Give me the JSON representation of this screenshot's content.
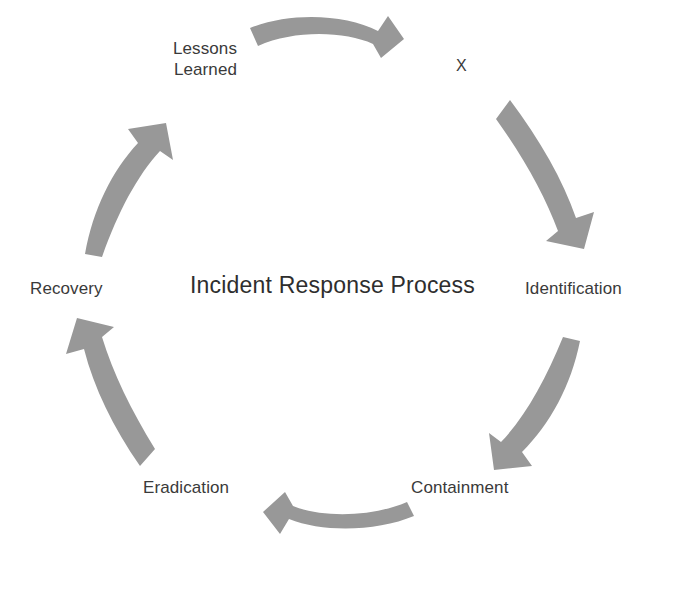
{
  "diagram": {
    "title": "Incident Response Process",
    "type": "cycle",
    "direction": "clockwise",
    "background_color": "#ffffff",
    "arrow_color": "#989898",
    "text_color": "#3a3a3a",
    "title_color": "#2e2e2e",
    "stages": [
      {
        "id": "lessons-learned",
        "label": "Lessons\nLearned",
        "position": "top-left"
      },
      {
        "id": "identification",
        "label": "Identification",
        "position": "right"
      },
      {
        "id": "containment",
        "label": "Containment",
        "position": "bottom-right"
      },
      {
        "id": "eradication",
        "label": "Eradication",
        "position": "bottom-left"
      },
      {
        "id": "recovery",
        "label": "Recovery",
        "position": "left"
      }
    ],
    "marker": {
      "id": "marker-x",
      "label": "X",
      "position": "top-right"
    },
    "arrows": [
      {
        "id": "arrow-top",
        "from": "lessons-learned",
        "to": "identification",
        "points": "right"
      },
      {
        "id": "arrow-upper-right",
        "from": "identification",
        "to": "identification",
        "points": "down"
      },
      {
        "id": "arrow-lower-right",
        "from": "identification",
        "to": "containment",
        "points": "down-left"
      },
      {
        "id": "arrow-bottom",
        "from": "containment",
        "to": "eradication",
        "points": "left"
      },
      {
        "id": "arrow-lower-left",
        "from": "eradication",
        "to": "recovery",
        "points": "up"
      },
      {
        "id": "arrow-upper-left",
        "from": "recovery",
        "to": "lessons-learned",
        "points": "up-right"
      }
    ]
  }
}
